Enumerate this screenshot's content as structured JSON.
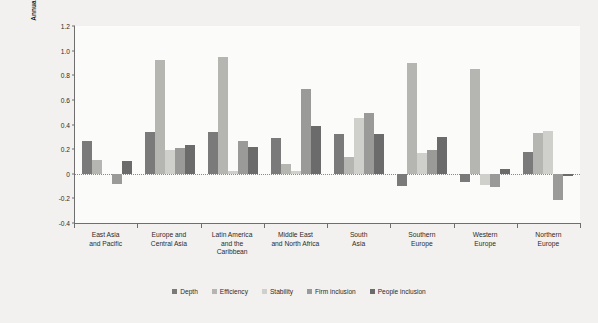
{
  "chart_data": {
    "type": "bar",
    "title": "",
    "subtitle": "",
    "xlabel": "",
    "ylabel": "Annual percentage point contribution to growth",
    "ylim": [
      -0.4,
      1.2
    ],
    "yticks": [
      1.2,
      1.0,
      0.8,
      0.6,
      0.4,
      0.2,
      0,
      -0.2,
      -0.4
    ],
    "ytick_labels": [
      "1.2",
      "1.0",
      "0.8",
      "0.6",
      "0.4",
      "0.2",
      "0",
      "-0.2",
      "-0.4"
    ],
    "grid": false,
    "zero_line": true,
    "legend_position": "bottom",
    "categories": [
      "East Asia\nand Pacific",
      "Europe and\nCentral Asia",
      "Latin America\nand the\nCaribbean",
      "Middle East\nand North Africa",
      "South\nAsia",
      "Southern\nEurope",
      "Western\nEurope",
      "Northern\nEurope"
    ],
    "category_lines": [
      [
        "East Asia",
        "and Pacific"
      ],
      [
        "Europe and",
        "Central Asia"
      ],
      [
        "Latin America",
        "and the",
        "Caribbean"
      ],
      [
        "Middle East",
        "and North Africa"
      ],
      [
        "South",
        "Asia"
      ],
      [
        "Southern",
        "Europe"
      ],
      [
        "Western",
        "Europe"
      ],
      [
        "Northern",
        "Europe"
      ]
    ],
    "series": [
      {
        "name": "Depth",
        "color": "#7a7a7a",
        "values": [
          0.27,
          0.34,
          0.34,
          0.29,
          0.32,
          -0.1,
          -0.07,
          0.18
        ]
      },
      {
        "name": "Efficiency",
        "color": "#b5b5b2",
        "values": [
          0.11,
          0.92,
          0.95,
          0.08,
          0.14,
          0.9,
          0.85,
          0.33
        ]
      },
      {
        "name": "Stability",
        "color": "#cfcfcb",
        "values": [
          0.0,
          0.19,
          0.02,
          0.02,
          0.45,
          0.17,
          -0.09,
          0.35
        ]
      },
      {
        "name": "Firm inclusion",
        "color": "#9a9a99",
        "values": [
          -0.08,
          0.21,
          0.27,
          0.69,
          0.49,
          0.19,
          -0.11,
          -0.21
        ]
      },
      {
        "name": "People inclusion",
        "color": "#6b6b6b",
        "values": [
          0.1,
          0.23,
          0.22,
          0.39,
          0.32,
          0.3,
          0.04,
          -0.02
        ]
      }
    ]
  },
  "axis": {
    "y_title": "Annual percentage point contribution to growth"
  }
}
